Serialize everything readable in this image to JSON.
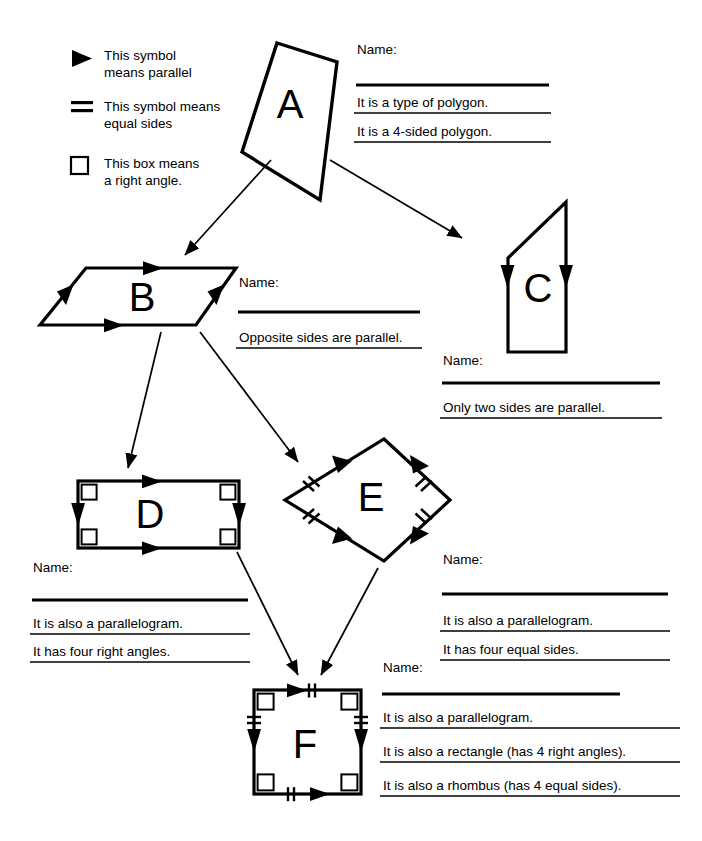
{
  "legend": {
    "items": [
      {
        "icon": "filled-triangle-icon",
        "text": "This symbol\nmeans parallel"
      },
      {
        "icon": "double-bar-icon",
        "text": "This symbol means\nequal sides"
      },
      {
        "icon": "open-square-icon",
        "text": "This box means\na right angle."
      }
    ]
  },
  "shapes": {
    "a": {
      "letter": "A"
    },
    "b": {
      "letter": "B"
    },
    "c": {
      "letter": "C"
    },
    "d": {
      "letter": "D"
    },
    "e": {
      "letter": "E"
    },
    "f": {
      "letter": "F"
    }
  },
  "blocks": {
    "a": {
      "name_label": "Name:",
      "statements": [
        "It is a type of polygon.",
        "It is a 4-sided polygon."
      ]
    },
    "b": {
      "name_label": "Name:",
      "statements": [
        "Opposite sides are parallel."
      ]
    },
    "c": {
      "name_label": "Name:",
      "statements": [
        "Only two sides are parallel."
      ]
    },
    "d": {
      "name_label": "Name:",
      "statements": [
        "It is also a parallelogram.",
        "It has four right angles."
      ]
    },
    "e": {
      "name_label": "Name:",
      "statements": [
        "It is also a parallelogram.",
        "It has four equal sides."
      ]
    },
    "f": {
      "name_label": "Name:",
      "statements": [
        "It is also a parallelogram.",
        "It is also a rectangle (has 4 right angles).",
        "It is also a rhombus (has 4 equal sides)."
      ]
    }
  },
  "colors": {
    "ink": "#000000",
    "paper": "#ffffff"
  }
}
